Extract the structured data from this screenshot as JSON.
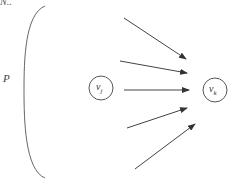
{
  "diagram": {
    "top_fragment": "N..",
    "set_label": "P",
    "nodes": [
      {
        "id": "vj",
        "label": "v",
        "subscript": "j"
      },
      {
        "id": "vk",
        "label": "v",
        "subscript": "k"
      }
    ],
    "edges_count": 5,
    "stroke_color": "#444444"
  }
}
